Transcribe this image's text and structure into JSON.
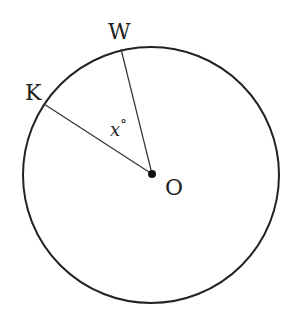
{
  "diagram": {
    "type": "circle-central-angle",
    "colors": {
      "stroke": "#222222",
      "background": "#ffffff"
    },
    "circle": {
      "center_label": "O",
      "cx": 151,
      "cy": 175,
      "r": 128
    },
    "points": [
      {
        "name": "W",
        "label": "W",
        "x": 121,
        "y": 49
      },
      {
        "name": "K",
        "label": "K",
        "x": 44,
        "y": 104
      }
    ],
    "segments": [
      {
        "from": "O",
        "to": "W"
      },
      {
        "from": "O",
        "to": "K"
      }
    ],
    "angle": {
      "vertex": "O",
      "between": [
        "K",
        "W"
      ],
      "label": "x°",
      "variable": "x",
      "unit": "°"
    },
    "labels": {
      "W": "W",
      "K": "K",
      "O": "O",
      "angle_var": "x",
      "angle_unit": "°"
    }
  }
}
